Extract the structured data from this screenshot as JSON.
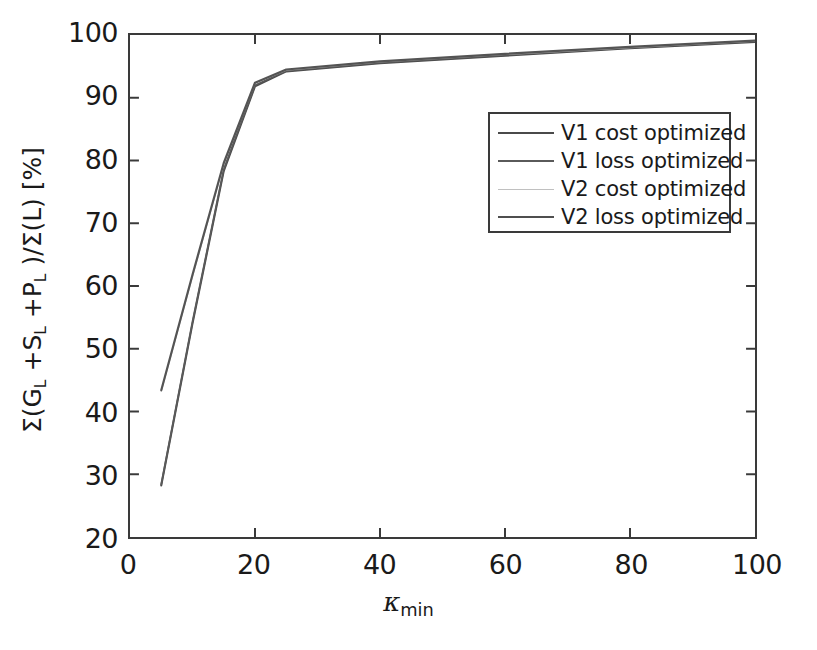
{
  "chart_data": {
    "type": "line",
    "title": "",
    "xlabel": "κ_min",
    "xlabel_base": "κ",
    "xlabel_sub": "min",
    "ylabel": "Σ(G_L +S_L +P_L )/Σ(L) [%]",
    "ylabel_parts": {
      "p1": "Σ(G",
      "s1": "L",
      "p2": " +S",
      "s2": "L",
      "p3": " +P",
      "s3": "L",
      "p4": " )/Σ(L) [%]"
    },
    "xlim": [
      0,
      100
    ],
    "ylim": [
      20,
      100
    ],
    "xticks": [
      0,
      20,
      40,
      60,
      80,
      100
    ],
    "yticks": [
      20,
      30,
      40,
      50,
      60,
      70,
      80,
      90,
      100
    ],
    "xtick_labels": [
      "0",
      "20",
      "40",
      "60",
      "80",
      "100"
    ],
    "ytick_labels": [
      "20",
      "30",
      "40",
      "50",
      "60",
      "70",
      "80",
      "90",
      "100"
    ],
    "grid": false,
    "legend_position": "upper right inside",
    "x": [
      5,
      10,
      15,
      20,
      25,
      40,
      60,
      80,
      100
    ],
    "series": [
      {
        "name": "V1 cost optimized",
        "color": "#4a4a4a",
        "width": 2.0,
        "values": [
          28.2,
          54.0,
          78.3,
          91.8,
          94.2,
          95.5,
          96.7,
          97.9,
          98.9
        ]
      },
      {
        "name": "V1 loss optimized",
        "color": "#5a5a5a",
        "width": 1.8,
        "values": [
          28.4,
          54.3,
          78.6,
          92.0,
          94.3,
          95.6,
          96.8,
          98.0,
          99.0
        ]
      },
      {
        "name": "V2 cost optimized",
        "color": "#b4b4b4",
        "width": 1.2,
        "values": [
          43.2,
          61.5,
          79.4,
          92.3,
          94.4,
          95.7,
          96.9,
          98.0,
          99.0
        ]
      },
      {
        "name": "V2 loss optimized",
        "color": "#545454",
        "width": 2.2,
        "values": [
          43.4,
          61.8,
          79.6,
          92.4,
          94.5,
          95.8,
          97.0,
          98.1,
          99.1
        ]
      }
    ],
    "legend": [
      {
        "label": "V1 cost optimized",
        "color": "#4a4a4a",
        "width": 2.0
      },
      {
        "label": "V1 loss optimized",
        "color": "#5a5a5a",
        "width": 2.2
      },
      {
        "label": "V2 cost optimized",
        "color": "#c0c0c0",
        "width": 1.2
      },
      {
        "label": "V2 loss optimized",
        "color": "#4f4f4f",
        "width": 2.6
      }
    ],
    "axis_color": "#3a3a3a",
    "background": "#ffffff"
  }
}
